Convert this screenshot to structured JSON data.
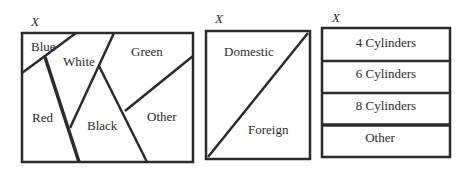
{
  "diagrams": [
    {
      "set_label": "X",
      "partition": "color",
      "regions": [
        "Blue",
        "White",
        "Green",
        "Red",
        "Black",
        "Other"
      ]
    },
    {
      "set_label": "X",
      "partition": "origin",
      "regions": [
        "Domestic",
        "Foreign"
      ]
    },
    {
      "set_label": "X",
      "partition": "cylinders",
      "regions": [
        "4 Cylinders",
        "6 Cylinders",
        "8 Cylinders",
        "Other"
      ]
    }
  ]
}
